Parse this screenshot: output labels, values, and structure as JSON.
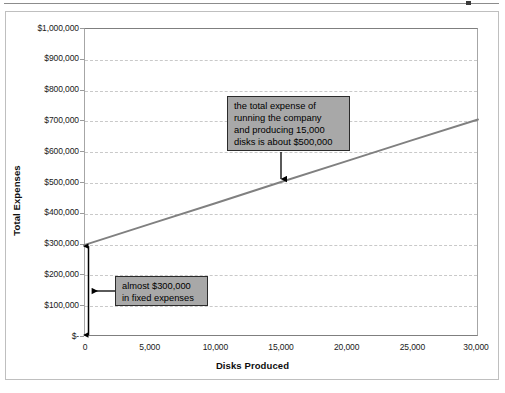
{
  "chart_data": {
    "type": "line",
    "title": "",
    "subtitle": "",
    "xlabel": "Disks Produced",
    "ylabel": "Total Expenses",
    "xlim": [
      0,
      30000
    ],
    "ylim": [
      0,
      1000000
    ],
    "grid": true,
    "legend": "none",
    "x_ticks": [
      "0",
      "5,000",
      "10,000",
      "15,000",
      "20,000",
      "25,000",
      "30,000"
    ],
    "x_tick_values": [
      0,
      5000,
      10000,
      15000,
      20000,
      25000,
      30000
    ],
    "y_ticks": [
      "$-",
      "$100,000",
      "$200,000",
      "$300,000",
      "$400,000",
      "$500,000",
      "$600,000",
      "$700,000",
      "$800,000",
      "$900,000",
      "$1,000,000"
    ],
    "y_tick_values": [
      0,
      100000,
      200000,
      300000,
      400000,
      500000,
      600000,
      700000,
      800000,
      900000,
      1000000
    ],
    "series": [
      {
        "name": "Total Expenses",
        "color": "#808080",
        "x": [
          0,
          5000,
          10000,
          15000,
          20000,
          25000,
          30000
        ],
        "values": [
          295000,
          363000,
          431000,
          500000,
          568000,
          636000,
          703000
        ]
      }
    ],
    "annotations": [
      {
        "name": "total-expense-callout",
        "text": "the total  expense of\nrunning the company\nand producing 15,000\ndisks is about $500,000",
        "points_to_x": 15000,
        "points_to_y": 500000
      },
      {
        "name": "fixed-expense-callout",
        "text": "almost $300,000\nin fixed expenses",
        "points_to_x": 0,
        "points_to_y": 150000
      }
    ],
    "markers": [
      {
        "name": "fixed-expense-range-arrow",
        "type": "double-headed-vertical-arrow",
        "x": 0,
        "y_from": 0,
        "y_to": 295000
      }
    ],
    "colors": {
      "series_line": "#808080",
      "gridline": "#c9c9c9",
      "plot_border": "#7f7f7f",
      "callout_fill": "#a8a8a8",
      "callout_border": "#2b2b2b",
      "frame_border": "#bfbfbf",
      "text": "#1a1a1a"
    }
  }
}
